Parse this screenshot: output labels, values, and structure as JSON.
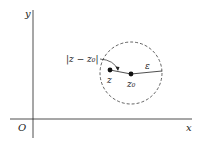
{
  "diagram": {
    "axes": {
      "x_label": "x",
      "y_label": "y",
      "origin_label": "O"
    },
    "annotation": "|z − z₀|",
    "points": [
      {
        "label": "z"
      },
      {
        "label": "z₀"
      }
    ],
    "radius_label": "ε",
    "colors": {
      "stroke": "#222222",
      "background": "#ffffff"
    }
  }
}
